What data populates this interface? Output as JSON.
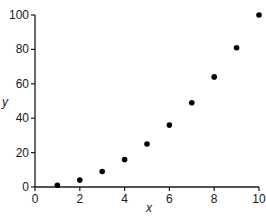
{
  "chart_data": {
    "type": "scatter",
    "title": "",
    "xlabel": "x",
    "ylabel": "y",
    "xlim": [
      0,
      10
    ],
    "ylim": [
      0,
      100
    ],
    "x_ticks": [
      0,
      2,
      4,
      6,
      8,
      10
    ],
    "y_ticks": [
      0,
      20,
      40,
      60,
      80,
      100
    ],
    "grid": false,
    "legend": null,
    "series": [
      {
        "name": "y = x^2",
        "marker": "filled-circle",
        "color": "#000000",
        "x": [
          1,
          2,
          3,
          4,
          5,
          6,
          7,
          8,
          9,
          10
        ],
        "y": [
          1,
          4,
          9,
          16,
          25,
          36,
          49,
          64,
          81,
          100
        ]
      }
    ]
  },
  "layout": {
    "x_axis_left_px": 35,
    "x_axis_right_px": 259,
    "y_axis_bottom_px": 187,
    "y_axis_top_px": 15
  }
}
